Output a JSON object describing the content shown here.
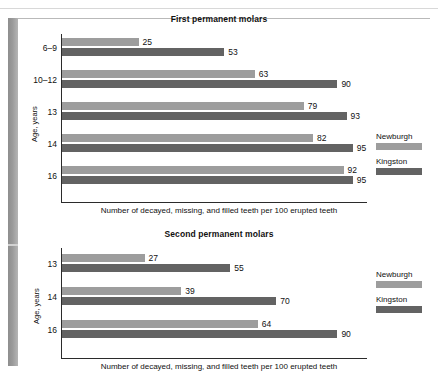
{
  "chart_data": [
    {
      "type": "bar",
      "orientation": "horizontal",
      "title": "First permanent molars",
      "xlabel": "Number of decayed, missing, and filled teeth per 100 erupted teeth",
      "ylabel": "Age, years",
      "categories": [
        "6–9",
        "10–12",
        "13",
        "14",
        "16"
      ],
      "series": [
        {
          "name": "Newburgh",
          "color": "#9d9d9d",
          "values": [
            25,
            63,
            79,
            82,
            92
          ]
        },
        {
          "name": "Kingston",
          "color": "#636363",
          "values": [
            53,
            90,
            93,
            95,
            95
          ]
        }
      ],
      "xlim": [
        0,
        100
      ],
      "grid": false,
      "legend_position": "right"
    },
    {
      "type": "bar",
      "orientation": "horizontal",
      "title": "Second permanent molars",
      "xlabel": "Number of decayed, missing, and filled teeth per 100 erupted teeth",
      "ylabel": "Age, years",
      "categories": [
        "13",
        "14",
        "16"
      ],
      "series": [
        {
          "name": "Newburgh",
          "color": "#9d9d9d",
          "values": [
            27,
            39,
            64
          ]
        },
        {
          "name": "Kingston",
          "color": "#636363",
          "values": [
            55,
            70,
            90
          ]
        }
      ],
      "xlim": [
        0,
        100
      ],
      "grid": false,
      "legend_position": "right"
    }
  ],
  "charts": {
    "first": {
      "title": "First permanent molars",
      "ylabel": "Age, years",
      "xlabel": "Number of decayed, missing, and filled teeth per 100 erupted teeth",
      "groups": [
        {
          "category": "6–9",
          "newburgh": 25,
          "kingston": 53
        },
        {
          "category": "10–12",
          "newburgh": 63,
          "kingston": 90
        },
        {
          "category": "13",
          "newburgh": 79,
          "kingston": 93
        },
        {
          "category": "14",
          "newburgh": 82,
          "kingston": 95
        },
        {
          "category": "16",
          "newburgh": 92,
          "kingston": 95
        }
      ],
      "legend": {
        "newburgh_label": "Newburgh",
        "kingston_label": "Kingston"
      }
    },
    "second": {
      "title": "Second permanent molars",
      "ylabel": "Age, years",
      "xlabel": "Number of decayed, missing, and filled teeth per 100 erupted teeth",
      "groups": [
        {
          "category": "13",
          "newburgh": 27,
          "kingston": 55
        },
        {
          "category": "14",
          "newburgh": 39,
          "kingston": 70
        },
        {
          "category": "16",
          "newburgh": 64,
          "kingston": 90
        }
      ],
      "legend": {
        "newburgh_label": "Newburgh",
        "kingston_label": "Kingston"
      }
    }
  },
  "colors": {
    "newburgh": "#9d9d9d",
    "kingston": "#636363",
    "axis": "#2b2b2b",
    "text": "#111111",
    "page_edge": "#9a9a9a"
  }
}
